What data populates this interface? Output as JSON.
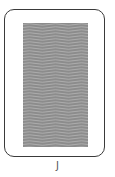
{
  "card": {
    "face": "back",
    "pattern": "wavy-lines",
    "colors": {
      "border": "#3a3a3a",
      "background": "#ffffff",
      "pattern_fill": "#8c8c8c",
      "pattern_lines": "#b0b0b0"
    }
  },
  "label": "J"
}
